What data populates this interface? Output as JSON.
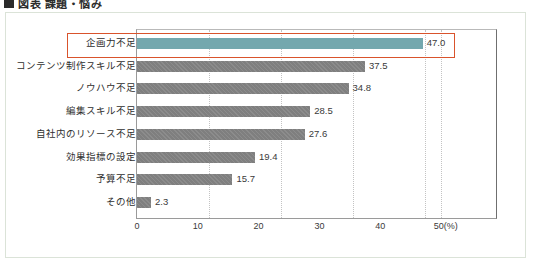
{
  "title": {
    "bullet": "square-bullet",
    "text": "図表 課題・悩み"
  },
  "chart_data": {
    "type": "bar",
    "orientation": "horizontal",
    "title": "図表 課題・悩み",
    "xlabel": "(%)",
    "ylabel": "",
    "xlim": [
      0,
      50
    ],
    "ticks": [
      "0",
      "10",
      "20",
      "30",
      "40",
      "50"
    ],
    "unit_label": "(%)",
    "grid": true,
    "legend": "none",
    "categories": [
      "企画力不足",
      "コンテンツ制作スキル不足",
      "ノウハウ不足",
      "編集スキル不足",
      "自社内のリソース不足",
      "効果指標の設定",
      "予算不足",
      "その他"
    ],
    "values": [
      47.0,
      37.5,
      34.8,
      28.5,
      27.6,
      19.4,
      15.7,
      2.3
    ],
    "value_labels": [
      "47.0",
      "37.5",
      "34.8",
      "28.5",
      "27.6",
      "19.4",
      "15.7",
      "2.3"
    ],
    "highlighted_index": 0,
    "colors": {
      "highlight_bar": "#74a8ae",
      "bar": "#7f7f7f",
      "highlight_outline": "#d9532c",
      "grid": "#c3c3c3",
      "frame": "#dbe3d8"
    }
  }
}
